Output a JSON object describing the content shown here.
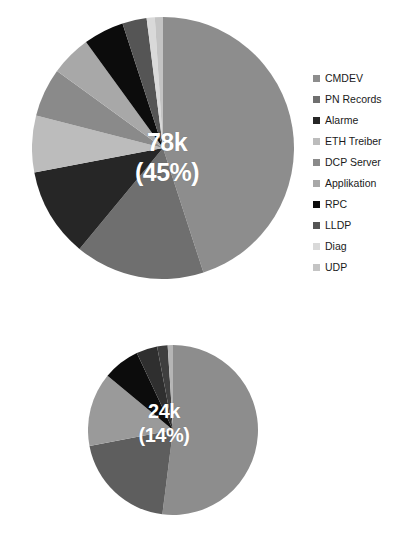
{
  "chart_data": [
    {
      "type": "pie",
      "id": "top-pie",
      "title": "",
      "legend_position": "right",
      "callout": {
        "value": "78k",
        "percent": "(45%)",
        "slice": "CMDEV"
      },
      "categories": [
        "CMDEV",
        "PN Records",
        "Alarme",
        "ETH Treiber",
        "DCP Server",
        "Applikation",
        "RPC",
        "LLDP",
        "Diag",
        "UDP"
      ],
      "values": [
        45,
        16,
        11,
        7,
        6,
        5,
        5,
        3,
        1,
        1
      ],
      "value_labels": [
        "78k",
        "28k",
        "19k",
        "12k",
        "10k",
        "9k",
        "9k",
        "5k",
        "2k",
        "2k"
      ],
      "colors": [
        "#8d8d8d",
        "#6f6f6f",
        "#262626",
        "#bcbcbc",
        "#8a8a8a",
        "#a8a8a8",
        "#0c0c0c",
        "#555555",
        "#d9d9d9",
        "#c4c4c4"
      ],
      "legend": [
        {
          "label": "CMDEV",
          "color": "#8d8d8d"
        },
        {
          "label": "PN Records",
          "color": "#6f6f6f"
        },
        {
          "label": "Alarme",
          "color": "#262626"
        },
        {
          "label": "ETH Treiber",
          "color": "#bcbcbc"
        },
        {
          "label": "DCP Server",
          "color": "#8a8a8a"
        },
        {
          "label": "Applikation",
          "color": "#a8a8a8"
        },
        {
          "label": "RPC",
          "color": "#0c0c0c"
        },
        {
          "label": "LLDP",
          "color": "#555555"
        },
        {
          "label": "Diag",
          "color": "#d9d9d9"
        },
        {
          "label": "UDP",
          "color": "#c4c4c4"
        }
      ]
    },
    {
      "type": "pie",
      "id": "bottom-pie",
      "title": "",
      "legend_position": "right",
      "callout": {
        "value": "24k",
        "percent": "(14%)",
        "slice": "ETH Treiber"
      },
      "categories": [
        "ETH Treiber",
        "CMDEV",
        "DCP Server",
        "RPC",
        "LLDP",
        "Alarme",
        "Applikation"
      ],
      "values": [
        52,
        20,
        14,
        7,
        4,
        2,
        1
      ],
      "value_labels": [
        "24k",
        "9k",
        "7k",
        "3k",
        "2k",
        "1k",
        "1k"
      ],
      "colors": [
        "#8d8d8d",
        "#5e5e5e",
        "#9a9a9a",
        "#0c0c0c",
        "#2f2f2f",
        "#3f3f3f",
        "#b5b5b5"
      ],
      "legend": [
        {
          "label": "ETH Treiber",
          "color": "#8d8d8d"
        },
        {
          "label": "CMDEV",
          "color": "#5e5e5e"
        },
        {
          "label": "DCP Server",
          "color": "#9a9a9a"
        },
        {
          "label": "RPC",
          "color": "#0c0c0c"
        },
        {
          "label": "LLDP",
          "color": "#2f2f2f"
        },
        {
          "label": "Alarme",
          "color": "#3f3f3f"
        },
        {
          "label": "Applikation",
          "color": "#b5b5b5"
        }
      ]
    }
  ]
}
